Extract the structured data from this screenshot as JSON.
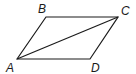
{
  "figure": {
    "type": "parallelogram",
    "vertices": [
      {
        "name": "A",
        "x": 17,
        "y": 59
      },
      {
        "name": "B",
        "x": 46,
        "y": 17
      },
      {
        "name": "C",
        "x": 118,
        "y": 17
      },
      {
        "name": "D",
        "x": 90,
        "y": 59
      }
    ],
    "edges": [
      [
        "A",
        "B"
      ],
      [
        "B",
        "C"
      ],
      [
        "C",
        "D"
      ],
      [
        "D",
        "A"
      ]
    ],
    "diagonals": [
      [
        "A",
        "C"
      ]
    ],
    "labels": {
      "A": "A",
      "B": "B",
      "C": "C",
      "D": "D"
    }
  }
}
